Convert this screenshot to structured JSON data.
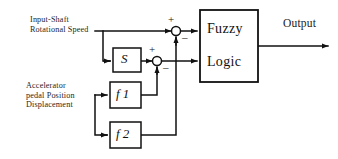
{
  "diagram": {
    "canvas": {
      "width": 338,
      "height": 159,
      "background": "#ffffff",
      "line_color": "#111111"
    },
    "inputs": [
      {
        "id": "input-shaft",
        "lines": [
          "Input-Shaft",
          "Rotational Speed"
        ],
        "x": 30,
        "y": 16
      },
      {
        "id": "accelerator",
        "lines": [
          "Accelerator",
          "pedal Position",
          "Displacement"
        ],
        "x": 26,
        "y": 82
      }
    ],
    "blocks": [
      {
        "id": "s-block",
        "label": "S",
        "x": 113,
        "y": 48,
        "w": 28,
        "h": 24
      },
      {
        "id": "f1-block",
        "label": "f 1",
        "x": 110,
        "y": 82,
        "w": 31,
        "h": 26
      },
      {
        "id": "f2-block",
        "label": "f 2",
        "x": 110,
        "y": 122,
        "w": 31,
        "h": 26
      },
      {
        "id": "fuzzy-logic-block",
        "label_line1": "Fuzzy",
        "label_line2": "Logic",
        "x": 200,
        "y": 10,
        "w": 58,
        "h": 72
      }
    ],
    "summing_junctions": [
      {
        "id": "sum-upper",
        "cx": 176,
        "cy": 31,
        "r": 4.5,
        "plus": "+",
        "minus": "–"
      },
      {
        "id": "sum-lower",
        "cx": 157,
        "cy": 61,
        "r": 4.5,
        "plus": "+",
        "minus": "–"
      }
    ],
    "output": {
      "label": "Output",
      "x": 283,
      "y": 18
    }
  }
}
